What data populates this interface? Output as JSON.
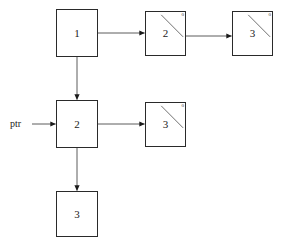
{
  "diagram": {
    "background_color": "#ffffff",
    "line_color": "#4a4a4a",
    "border_color": "#2a2a2a",
    "text_color": "#1a1a1a",
    "pointer_label": "ptr",
    "null_symbol": "0",
    "nodes": [
      {
        "id": "node-top-1",
        "value": "1",
        "row": "top",
        "has_null_slash": false
      },
      {
        "id": "node-top-2",
        "value": "2",
        "row": "top",
        "has_null_slash": true,
        "null_marker": "0"
      },
      {
        "id": "node-top-3",
        "value": "3",
        "row": "top",
        "has_null_slash": true,
        "null_marker": "0"
      },
      {
        "id": "node-mid-2",
        "value": "2",
        "row": "middle",
        "has_null_slash": false
      },
      {
        "id": "node-mid-3",
        "value": "3",
        "row": "middle",
        "has_null_slash": true,
        "null_marker": "0"
      },
      {
        "id": "node-bottom-3",
        "value": "3",
        "row": "bottom",
        "has_null_slash": false
      }
    ],
    "edges": [
      {
        "id": "edge-ptr-to-mid2",
        "from": "ptr",
        "to": "node-mid-2",
        "direction": "right"
      },
      {
        "id": "edge-top1-to-top2",
        "from": "node-top-1",
        "to": "node-top-2",
        "direction": "right"
      },
      {
        "id": "edge-top2-to-top3",
        "from": "node-top-2",
        "to": "node-top-3",
        "direction": "right"
      },
      {
        "id": "edge-top1-to-mid2",
        "from": "node-top-1",
        "to": "node-mid-2",
        "direction": "down"
      },
      {
        "id": "edge-mid2-to-mid3",
        "from": "node-mid-2",
        "to": "node-mid-3",
        "direction": "right"
      },
      {
        "id": "edge-mid2-to-bottom3",
        "from": "node-mid-2",
        "to": "node-bottom-3",
        "direction": "down"
      }
    ]
  }
}
